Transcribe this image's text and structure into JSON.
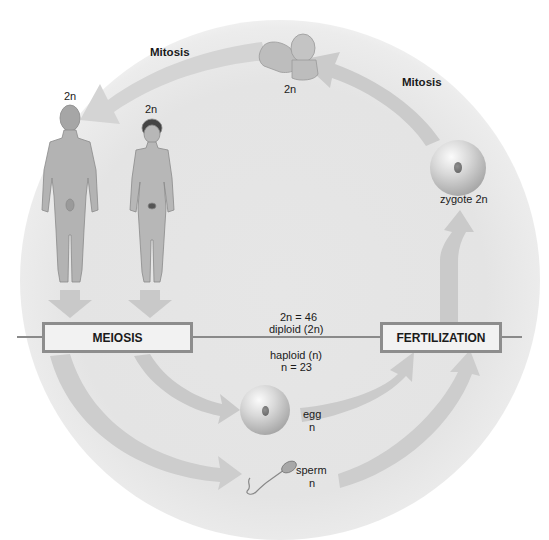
{
  "diagram": {
    "colors": {
      "background_disc": "#e4e4e4",
      "arrow": "#c9c9c9",
      "box_border": "#8d8d8d",
      "box_fill": "#f2f2f2",
      "line": "#8a8a8a",
      "text": "#1a1a1a"
    },
    "labels": {
      "mitosis_left": "Mitosis",
      "mitosis_right": "Mitosis",
      "baby_ploidy": "2n",
      "man_ploidy": "2n",
      "woman_ploidy": "2n",
      "zygote": "zygote 2n",
      "egg_name": "egg",
      "egg_ploidy": "n",
      "sperm_name": "sperm",
      "sperm_ploidy": "n",
      "diploid_count": "2n = 46",
      "diploid_label": "diploid (2n)",
      "haploid_label": "haploid (n)",
      "haploid_count": "n = 23"
    },
    "boxes": {
      "meiosis": "MEIOSIS",
      "fertilization": "FERTILIZATION"
    },
    "figures": [
      "baby",
      "adult-male",
      "adult-female",
      "zygote",
      "egg",
      "sperm"
    ]
  }
}
